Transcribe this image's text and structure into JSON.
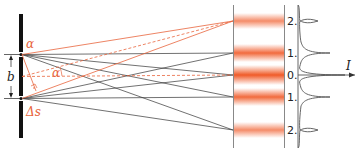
{
  "diagram": {
    "labels": {
      "alpha_top": "α",
      "alpha_mid": "α",
      "slit_distance": "b",
      "path_difference": "Δs",
      "intensity": "I"
    },
    "orders": [
      "2.",
      "1.",
      "0.",
      "1.",
      "2."
    ],
    "colors": {
      "ray": "#333333",
      "highlight": "#e8643c",
      "fringe": "#f05a28",
      "barrier": "#111111",
      "screen": "#888888"
    }
  }
}
